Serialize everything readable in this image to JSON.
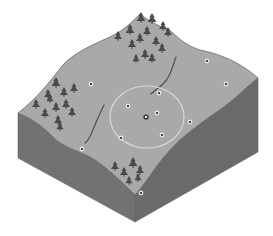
{
  "diagram": {
    "colors": {
      "background": "#ffffff",
      "surface": "#a9a9a9",
      "surface_edge": "#6a6a6a",
      "side_left": "#727272",
      "side_right": "#6a6a6a",
      "tree": "#4a4a4a",
      "stream": "#4a4a4a",
      "circle": "#d8d8d8",
      "point_ring": "#e6e6e6",
      "point_dot": "#1e1e1e",
      "center_point": "#2a2a2a"
    },
    "search_circle": {
      "cx": 147,
      "cy": 117,
      "rx": 37,
      "ry": 31
    },
    "center_point": {
      "x": 146,
      "y": 117
    },
    "points": [
      {
        "x": 91,
        "y": 84
      },
      {
        "x": 207,
        "y": 61
      },
      {
        "x": 226,
        "y": 84
      },
      {
        "x": 159,
        "y": 93
      },
      {
        "x": 128,
        "y": 106
      },
      {
        "x": 157,
        "y": 113
      },
      {
        "x": 190,
        "y": 122
      },
      {
        "x": 162,
        "y": 135
      },
      {
        "x": 121,
        "y": 138
      },
      {
        "x": 82,
        "y": 149
      },
      {
        "x": 141,
        "y": 193
      }
    ],
    "tree_groups": [
      {
        "name": "north-forest",
        "trees": [
          [
            118,
            40,
            9
          ],
          [
            130,
            34,
            10
          ],
          [
            141,
            22,
            10
          ],
          [
            152,
            23,
            10
          ],
          [
            163,
            30,
            9
          ],
          [
            168,
            36,
            9
          ],
          [
            132,
            48,
            9
          ],
          [
            140,
            42,
            9
          ],
          [
            147,
            35,
            9
          ],
          [
            156,
            45,
            9
          ],
          [
            162,
            52,
            9
          ],
          [
            145,
            58,
            9
          ],
          [
            152,
            62,
            9
          ],
          [
            136,
            62,
            8
          ]
        ]
      },
      {
        "name": "west-forest",
        "trees": [
          [
            36,
            108,
            9
          ],
          [
            48,
            98,
            9
          ],
          [
            56,
            87,
            10
          ],
          [
            64,
            96,
            9
          ],
          [
            74,
            92,
            9
          ],
          [
            45,
            117,
            9
          ],
          [
            56,
            111,
            9
          ],
          [
            66,
            108,
            9
          ],
          [
            72,
            116,
            9
          ],
          [
            58,
            124,
            9
          ],
          [
            50,
            102,
            8
          ],
          [
            60,
            130,
            8
          ]
        ]
      },
      {
        "name": "south-forest",
        "trees": [
          [
            115,
            170,
            9
          ],
          [
            124,
            176,
            9
          ],
          [
            133,
            167,
            10
          ],
          [
            140,
            174,
            9
          ],
          [
            129,
            184,
            8
          ],
          [
            138,
            181,
            8
          ]
        ]
      }
    ],
    "streams": [
      "M176 57 C172 68, 170 78, 162 85 C158 88, 155 90, 151 94",
      "M104 105 C99 115, 96 122, 92 132 C90 137, 88 141, 85 143"
    ]
  }
}
